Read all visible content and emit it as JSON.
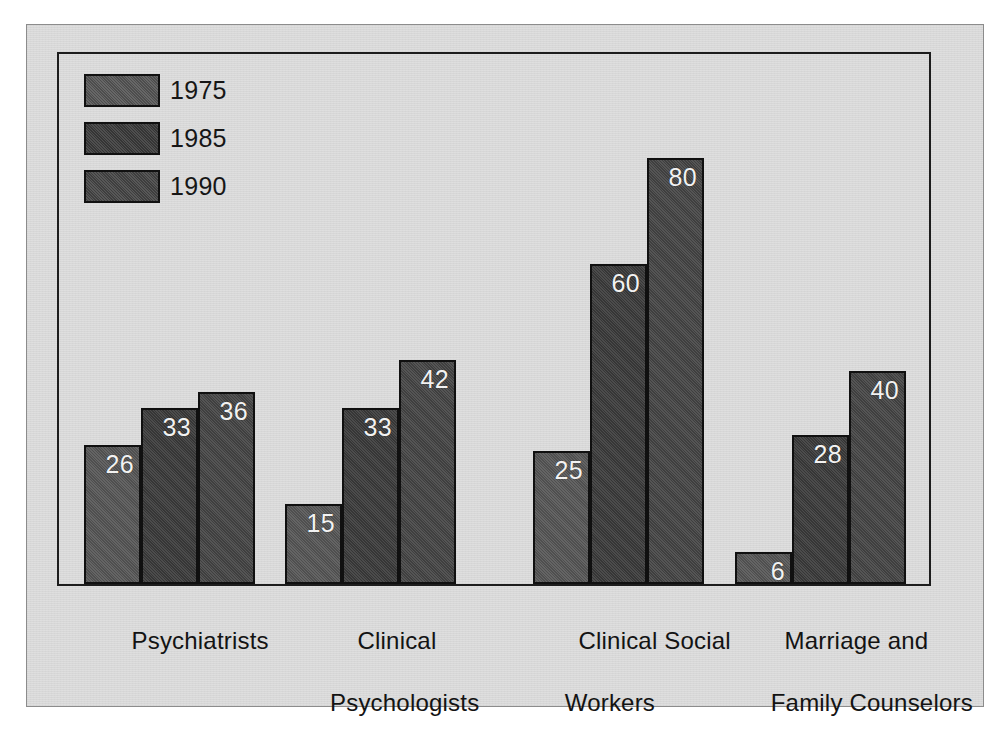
{
  "figure": {
    "panel_bg": "#dedede",
    "frame_color": "#1d1d1d",
    "page_bg": "#ffffff"
  },
  "legend": {
    "position": "top-left-inside-plot",
    "items": [
      {
        "label": "1975",
        "color": "#565656",
        "swatch_name": "legend-swatch-1975"
      },
      {
        "label": "1985",
        "color": "#3b3b3b",
        "swatch_name": "legend-swatch-1985"
      },
      {
        "label": "1990",
        "color": "#454545",
        "swatch_name": "legend-swatch-1990"
      }
    ]
  },
  "categories": [
    {
      "line1": "Psychiatrists",
      "line2": ""
    },
    {
      "line1": "Clinical",
      "line2": "Psychologists"
    },
    {
      "line1": "Clinical Social",
      "line2": "  Workers"
    },
    {
      "line1": "Marriage and",
      "line2": "  Family Counselors"
    }
  ],
  "chart_data": {
    "type": "bar",
    "title": "",
    "subtitle": "",
    "xlabel": "",
    "ylabel": "",
    "grid": false,
    "legend_position": "top-left",
    "value_labels": true,
    "value_label_color": "#f2f2f2",
    "axis_visible": {
      "left": true,
      "right": true,
      "top": true,
      "bottom": true
    },
    "ylim": [
      0,
      100
    ],
    "categories": [
      "Psychiatrists",
      "Clinical Psychologists",
      "Clinical Social Workers",
      "Marriage and Family Counselors"
    ],
    "series": [
      {
        "name": "1975",
        "color": "#565656",
        "values": [
          26,
          15,
          25,
          6
        ]
      },
      {
        "name": "1985",
        "color": "#3b3b3b",
        "values": [
          33,
          33,
          60,
          28
        ]
      },
      {
        "name": "1990",
        "color": "#454545",
        "values": [
          36,
          42,
          80,
          40
        ]
      }
    ]
  },
  "geometry": {
    "baseline_y": 530,
    "px_per_unit": 5.33,
    "bar_width": 57,
    "group_starts": [
      25,
      226,
      474,
      676
    ]
  }
}
